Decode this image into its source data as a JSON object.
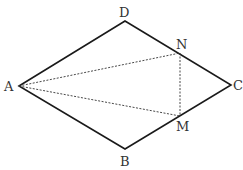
{
  "diagram": {
    "points": {
      "A": {
        "label": "A",
        "x": 19,
        "y": 86
      },
      "B": {
        "label": "B",
        "x": 125,
        "y": 149
      },
      "C": {
        "label": "C",
        "x": 231,
        "y": 85
      },
      "D": {
        "label": "D",
        "x": 125,
        "y": 21
      },
      "N": {
        "label": "N",
        "x": 180,
        "y": 53
      },
      "M": {
        "label": "M",
        "x": 180,
        "y": 116
      }
    },
    "solid_segments": [
      "AD",
      "DC",
      "CB",
      "BA"
    ],
    "dashed_segments": [
      "AN",
      "AM",
      "NM"
    ],
    "colors": {
      "line": "#1a1a1a",
      "label": "#333333",
      "background": "#ffffff"
    }
  }
}
